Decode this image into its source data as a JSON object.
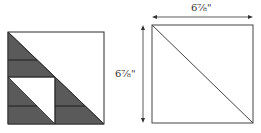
{
  "diagram": {
    "left_block": {
      "description": "Quilt block with half-square triangle units",
      "colors": {
        "dark": "#5a5a5a",
        "light": "#ffffff",
        "stroke": "#2a2a2a"
      }
    },
    "right_block": {
      "description": "Square cut diagonally",
      "width_label": "6⅞\"",
      "height_label": "6⅞\""
    }
  }
}
